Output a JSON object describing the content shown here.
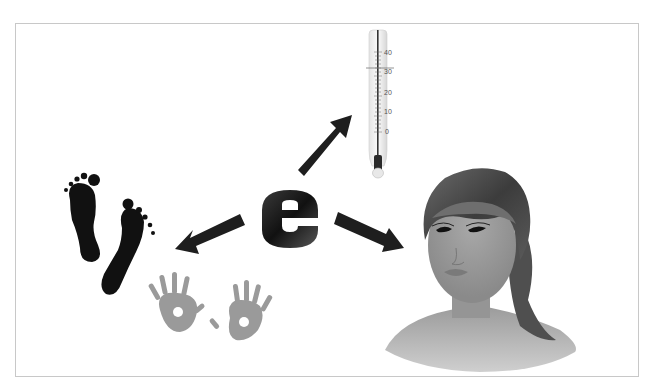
{
  "figure": {
    "center_letter": "e",
    "colors": {
      "frame_border": "#c8c8c8",
      "letter_dark": "#1a1a1a",
      "letter_light": "#5a5a5a",
      "arrow": "#1e1e1e",
      "footprint": "#111111",
      "handprint": "#9a9a9a",
      "skin": "#9a9a9a",
      "hair": "#4a4a4a"
    },
    "thermometer": {
      "labels": [
        "40",
        "30",
        "20",
        "10",
        "0"
      ],
      "marker_value": "33"
    },
    "arrows": [
      {
        "name": "arrow-to-thermometer",
        "direction": "up-right"
      },
      {
        "name": "arrow-to-prints",
        "direction": "down-left"
      },
      {
        "name": "arrow-to-face",
        "direction": "down-right"
      }
    ],
    "targets": [
      "thermometer",
      "footprints-and-handprints",
      "woman-portrait"
    ]
  }
}
